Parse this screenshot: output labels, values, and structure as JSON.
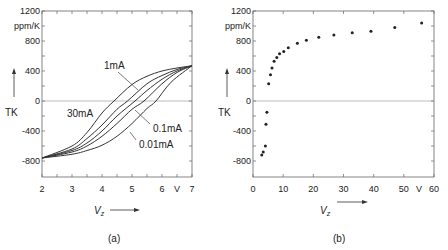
{
  "chart_data": [
    {
      "type": "line",
      "panel_label": "(a)",
      "xlabel": "V_z",
      "x_unit": "V",
      "ylabel": "TK",
      "y_unit": "ppm/K",
      "xlim": [
        2,
        7
      ],
      "ylim": [
        -1000,
        1200
      ],
      "x_ticks": [
        "2",
        "3",
        "4",
        "5",
        "6",
        "V",
        "7"
      ],
      "y_ticks": [
        "1200",
        "ppm/K",
        "800",
        "400",
        "0",
        "-400",
        "-800"
      ],
      "zero_line": true,
      "series": [
        {
          "name": "30mA",
          "x": [
            2,
            3,
            3.5,
            4,
            4.4,
            5,
            5.5,
            6,
            6.5,
            7
          ],
          "y": [
            -760,
            -600,
            -420,
            -160,
            0,
            220,
            330,
            400,
            440,
            470
          ]
        },
        {
          "name": "1mA",
          "x": [
            2,
            3,
            3.5,
            4,
            4.5,
            4.85,
            5.5,
            6,
            6.5,
            7
          ],
          "y": [
            -760,
            -640,
            -500,
            -320,
            -110,
            0,
            230,
            340,
            420,
            470
          ]
        },
        {
          "name": "(unlabeled)",
          "x": [
            2,
            3,
            3.5,
            4,
            4.5,
            5.1,
            5.5,
            6,
            6.5,
            7
          ],
          "y": [
            -760,
            -660,
            -560,
            -400,
            -200,
            0,
            140,
            290,
            400,
            470
          ]
        },
        {
          "name": "0.1mA",
          "x": [
            2,
            3,
            3.5,
            4,
            4.5,
            5,
            5.4,
            6,
            6.5,
            7
          ],
          "y": [
            -760,
            -680,
            -600,
            -470,
            -300,
            -110,
            0,
            230,
            380,
            470
          ]
        },
        {
          "name": "0.01mA",
          "x": [
            2,
            3,
            3.5,
            4,
            4.5,
            5,
            5.5,
            5.8,
            6.3,
            7
          ],
          "y": [
            -760,
            -710,
            -660,
            -590,
            -470,
            -300,
            -100,
            0,
            250,
            470
          ]
        }
      ],
      "annotations": [
        "1mA",
        "30mA",
        "0.1mA",
        "0.01mA"
      ]
    },
    {
      "type": "scatter",
      "panel_label": "(b)",
      "xlabel": "V_z",
      "x_unit": "V",
      "ylabel": "TK",
      "y_unit": "ppm/K",
      "xlim": [
        0,
        60
      ],
      "ylim": [
        -1000,
        1200
      ],
      "x_ticks": [
        "0",
        "10",
        "20",
        "30",
        "40",
        "50",
        "V",
        "60"
      ],
      "y_ticks": [
        "1200",
        "ppm/K",
        "800",
        "400",
        "0",
        "-400",
        "-800"
      ],
      "zero_line": true,
      "x": [
        2.9,
        3.4,
        4.1,
        4.3,
        4.6,
        5.2,
        5.8,
        6.3,
        7.0,
        7.9,
        8.8,
        10.2,
        11.7,
        14.7,
        17.7,
        21.8,
        26.8,
        32.9,
        39.1,
        47.0,
        55.9
      ],
      "y": [
        -720,
        -680,
        -600,
        -310,
        -150,
        230,
        350,
        440,
        530,
        580,
        630,
        660,
        710,
        770,
        810,
        850,
        880,
        910,
        930,
        980,
        1040
      ]
    }
  ]
}
